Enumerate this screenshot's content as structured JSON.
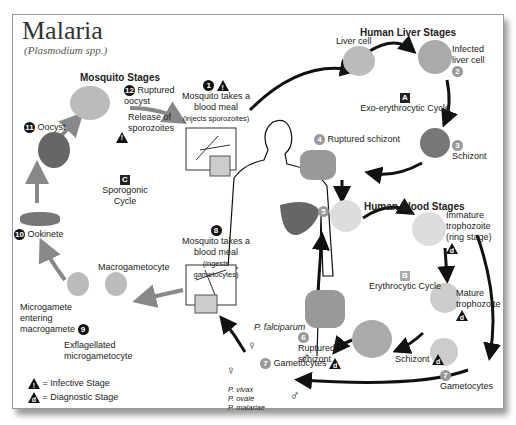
{
  "title": "Malaria",
  "subtitle": "(Plasmodium spp.)",
  "sections": {
    "mosquito": "Mosquito Stages",
    "liver": "Human Liver Stages",
    "blood": "Human Blood Stages"
  },
  "cycles": {
    "A": {
      "marker": "A",
      "label": "Exo-erythrocytic Cycle"
    },
    "B": {
      "marker": "B",
      "label": "Erythrocytic Cycle"
    },
    "C": {
      "marker": "C",
      "label": "Sporogonic Cycle"
    }
  },
  "stages": [
    {
      "num": "1",
      "label": "Mosquito takes a blood meal",
      "note": "(injects sporozoites)",
      "marker": "i"
    },
    {
      "num": "2",
      "label": "Infected liver cell"
    },
    {
      "num": "3",
      "label": "Schizont"
    },
    {
      "num": "4",
      "label": "Ruptured schizont"
    },
    {
      "num": "5",
      "label": ""
    },
    {
      "num": "6",
      "label": "Ruptured schizont"
    },
    {
      "num": "7",
      "label": "Gametocytes"
    },
    {
      "num": "8",
      "label": "Mosquito takes a blood meal",
      "note": "(ingests gametocytes)"
    },
    {
      "num": "9",
      "label": "Microgamete entering macrogamete"
    },
    {
      "num": "10",
      "label": "Ookinete"
    },
    {
      "num": "11",
      "label": "Oocyst"
    },
    {
      "num": "12",
      "label": "Ruptured oocyst"
    }
  ],
  "labels": {
    "liver_cell": "Liver cell",
    "release": "Release of sporozoites",
    "immature": "Immature trophozoite (ring stage)",
    "mature": "Mature trophozoite",
    "schizont_blood": "Schizont",
    "gametocytes_right": "Gametocytes",
    "macrogametocyte": "Macrogametocyte",
    "exflag": "Exflagellated microgametocyte",
    "p_falciparum": "P. falciparum",
    "p_others": [
      "P. vivax",
      "P. ovale",
      "P. malariae"
    ],
    "female": "♀",
    "male": "♂"
  },
  "legend": {
    "infective": {
      "marker": "i",
      "label": "= Infective Stage"
    },
    "diagnostic": {
      "marker": "d",
      "label": "= Diagnostic Stage"
    }
  }
}
